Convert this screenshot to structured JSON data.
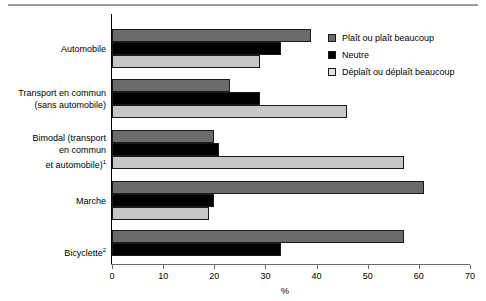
{
  "chart_data": {
    "type": "bar",
    "orientation": "horizontal",
    "title": "",
    "xlabel": "%",
    "ylabel": "",
    "xlim": [
      0,
      70
    ],
    "xticks": [
      0,
      10,
      20,
      30,
      40,
      50,
      60,
      70
    ],
    "grid": false,
    "legend_position": "top-right",
    "categories": [
      "Automobile",
      "Transport en commun (sans automobile)",
      "Bimodal (transport en commun et automobile)¹",
      "Marche",
      "Bicyclette²"
    ],
    "category_lines": [
      [
        "Automobile"
      ],
      [
        "Transport en commun",
        "(sans automobile)"
      ],
      [
        "Bimodal (transport",
        "en commun",
        "et automobile)¹"
      ],
      [
        "Marche"
      ],
      [
        "Bicyclette²"
      ]
    ],
    "series": [
      {
        "name": "Plaît ou plaît beaucoup",
        "color": "#6b6b6b",
        "values": [
          39,
          23,
          20,
          61,
          57
        ]
      },
      {
        "name": "Neutre",
        "color": "#000000",
        "values": [
          33,
          29,
          21,
          20,
          33
        ]
      },
      {
        "name": "Déplaît ou déplaît beaucoup",
        "color": "#c7c7c7",
        "values": [
          29,
          46,
          57,
          19,
          0
        ]
      }
    ]
  },
  "axis": {
    "tick_labels": [
      "0",
      "10",
      "20",
      "30",
      "40",
      "50",
      "60",
      "70"
    ],
    "unit_label": "%"
  },
  "legend": {
    "items": [
      {
        "label": "Plaît ou plaît beaucoup",
        "swatch": "dark-gray"
      },
      {
        "label": "Neutre",
        "swatch": "black"
      },
      {
        "label": "Déplaît ou déplaît beaucoup",
        "swatch": "light-gray"
      }
    ]
  }
}
